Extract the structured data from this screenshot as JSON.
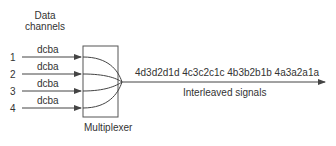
{
  "diagram": {
    "title": {
      "line1": "Data",
      "line2": "channels"
    },
    "channels": [
      {
        "number": "1",
        "data": "dcba"
      },
      {
        "number": "2",
        "data": "dcba"
      },
      {
        "number": "3",
        "data": "dcba"
      },
      {
        "number": "4",
        "data": "dcba"
      }
    ],
    "multiplexer_label": "Multiplexer",
    "output_sequence": "4d3d2d1d 4c3c2c1c 4b3b2b1b 4a3a2a1a",
    "output_label": "Interleaved signals",
    "colors": {
      "line": "#444444",
      "text": "#333333",
      "box": "#555555"
    }
  }
}
